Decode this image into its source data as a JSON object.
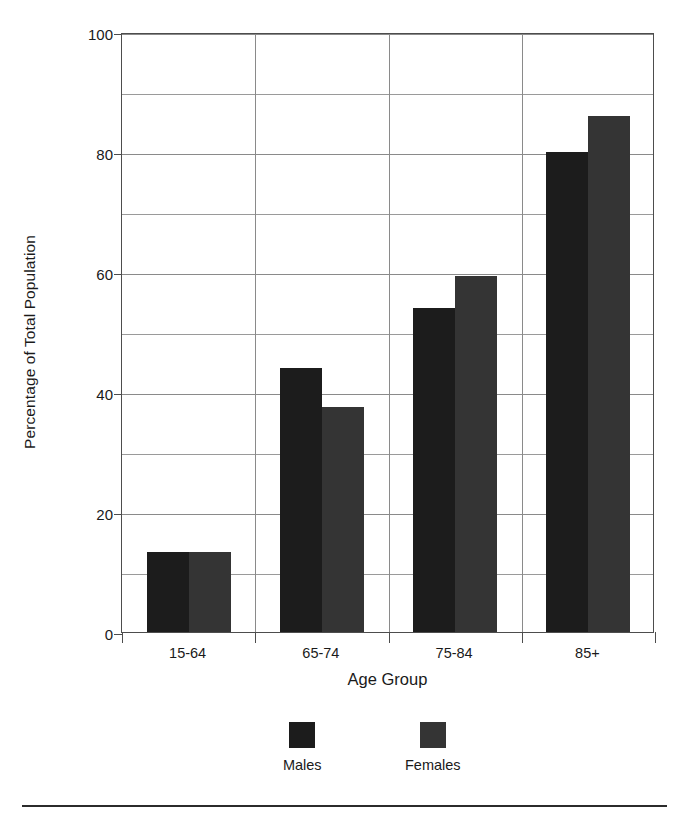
{
  "chart_data": {
    "type": "bar",
    "title": "",
    "xlabel": "Age Group",
    "ylabel": "Percentage of Total Population",
    "categories": [
      "15-64",
      "65-74",
      "75-84",
      "85+"
    ],
    "series": [
      {
        "name": "Males",
        "color": "#1c1c1c",
        "values": [
          13.3,
          44.0,
          54.0,
          80.0
        ]
      },
      {
        "name": "Females",
        "color": "#343434",
        "values": [
          13.4,
          37.5,
          59.4,
          86.0
        ]
      }
    ],
    "ylim": [
      0,
      100
    ],
    "ytick_labels": [
      "0",
      "20",
      "40",
      "60",
      "80",
      "100"
    ],
    "ytick_values": [
      0,
      20,
      40,
      60,
      80,
      100
    ],
    "gridline_values": [
      10,
      20,
      30,
      40,
      50,
      60,
      70,
      80,
      90,
      100
    ],
    "grid": true,
    "legend_position": "bottom"
  },
  "legend": {
    "entries": [
      {
        "label": "Males",
        "color": "#1c1c1c"
      },
      {
        "label": "Females",
        "color": "#343434"
      }
    ]
  },
  "axes": {
    "y_title": "Percentage of Total Population",
    "x_title": "Age Group"
  }
}
